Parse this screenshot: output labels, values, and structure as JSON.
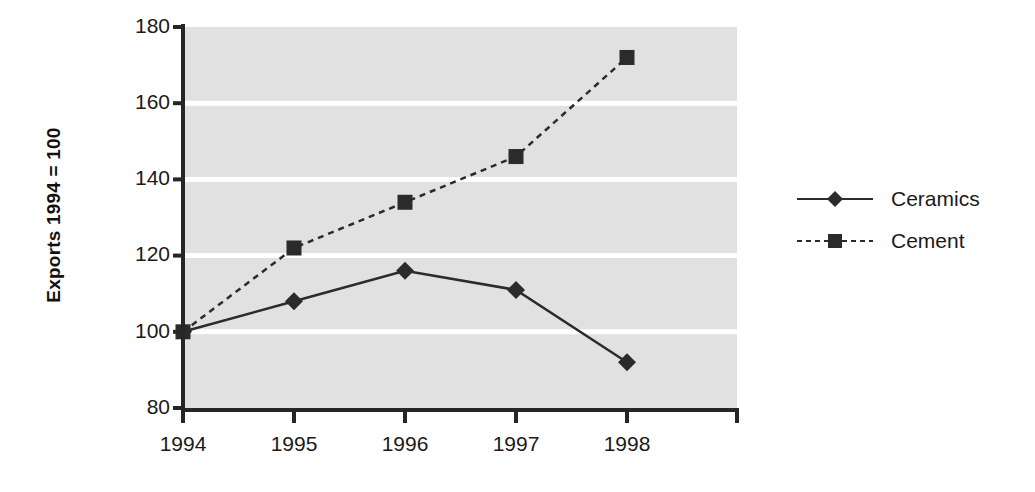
{
  "chart_data": {
    "type": "line",
    "title": "",
    "xlabel": "",
    "ylabel": "Exports 1994 = 100",
    "categories": [
      "1994",
      "1995",
      "1996",
      "1997",
      "1998"
    ],
    "x": [
      1994,
      1995,
      1996,
      1997,
      1998
    ],
    "series": [
      {
        "name": "Ceramics",
        "values": [
          100,
          108,
          116,
          111,
          92
        ],
        "line_style": "solid",
        "marker": "diamond",
        "color": "#2b2b2b"
      },
      {
        "name": "Cement",
        "values": [
          100,
          122,
          134,
          146,
          172
        ],
        "line_style": "dashed",
        "marker": "square",
        "color": "#2b2b2b"
      }
    ],
    "ylim": [
      80,
      180
    ],
    "xlim": [
      1994,
      1998
    ],
    "yticks": [
      "80",
      "100",
      "120",
      "140",
      "160",
      "180"
    ],
    "ytick_values": [
      80,
      100,
      120,
      140,
      160,
      180
    ],
    "grid": "horizontal-white",
    "legend_position": "right",
    "plot_background": "#e1e1e1",
    "gridline_color": "#ffffff",
    "axis_color": "#262626"
  },
  "legend": {
    "entries": [
      {
        "label": "Ceramics"
      },
      {
        "label": "Cement"
      }
    ]
  },
  "axes": {
    "y_label": "Exports 1994 = 100",
    "y_ticks": [
      {
        "label": "180"
      },
      {
        "label": "160"
      },
      {
        "label": "140"
      },
      {
        "label": "120"
      },
      {
        "label": "100"
      },
      {
        "label": "80"
      }
    ],
    "x_ticks": [
      {
        "label": "1994"
      },
      {
        "label": "1995"
      },
      {
        "label": "1996"
      },
      {
        "label": "1997"
      },
      {
        "label": "1998"
      }
    ]
  }
}
